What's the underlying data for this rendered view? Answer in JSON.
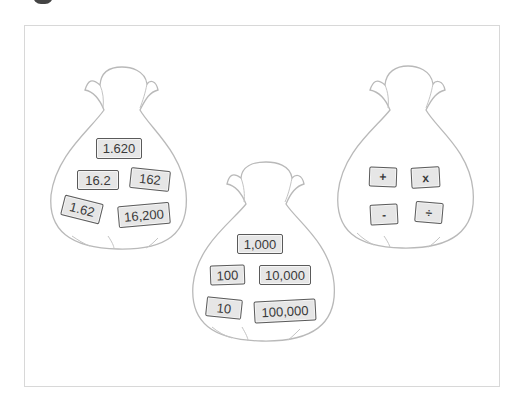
{
  "colors": {
    "bag_outline": "#b9b9b9",
    "card_fill": "#e6e6e6",
    "card_border": "#5a5a5a",
    "text": "#3a3a3a",
    "frame_border": "#d8d8d8"
  },
  "bags": [
    {
      "name": "decimal-numbers-bag",
      "cards": [
        {
          "label": "1.620",
          "x": 96,
          "y": 138,
          "w": 46,
          "h": 21,
          "rot": 0
        },
        {
          "label": "16.2",
          "x": 77,
          "y": 170,
          "w": 42,
          "h": 20,
          "rot": 0
        },
        {
          "label": "162",
          "x": 130,
          "y": 169,
          "w": 40,
          "h": 21,
          "rot": 6
        },
        {
          "label": "1.62",
          "x": 62,
          "y": 199,
          "w": 40,
          "h": 21,
          "rot": 14
        },
        {
          "label": "16,200",
          "x": 118,
          "y": 204,
          "w": 52,
          "h": 22,
          "rot": -5
        }
      ]
    },
    {
      "name": "powers-of-ten-bag",
      "cards": [
        {
          "label": "1,000",
          "x": 237,
          "y": 234,
          "w": 46,
          "h": 20,
          "rot": 0
        },
        {
          "label": "100",
          "x": 210,
          "y": 265,
          "w": 35,
          "h": 20,
          "rot": -2
        },
        {
          "label": "10,000",
          "x": 259,
          "y": 265,
          "w": 52,
          "h": 20,
          "rot": 0
        },
        {
          "label": "10",
          "x": 206,
          "y": 298,
          "w": 36,
          "h": 20,
          "rot": 6
        },
        {
          "label": "100,000",
          "x": 254,
          "y": 300,
          "w": 62,
          "h": 22,
          "rot": -3
        }
      ]
    },
    {
      "name": "operations-bag",
      "cards": [
        {
          "label": "+",
          "x": 369,
          "y": 167,
          "w": 28,
          "h": 20,
          "rot": 2
        },
        {
          "label": "x",
          "x": 411,
          "y": 167,
          "w": 29,
          "h": 21,
          "rot": -3
        },
        {
          "label": "-",
          "x": 370,
          "y": 204,
          "w": 28,
          "h": 21,
          "rot": -3
        },
        {
          "label": "÷",
          "x": 415,
          "y": 202,
          "w": 28,
          "h": 21,
          "rot": 5
        }
      ]
    }
  ]
}
